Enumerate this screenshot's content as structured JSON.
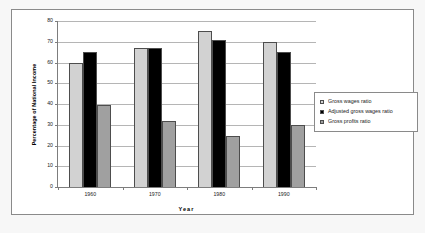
{
  "chart_data": {
    "type": "bar",
    "title": "",
    "subtitle": "",
    "xlabel": "Year",
    "ylabel": "Percentage of National Income",
    "categories": [
      "1960",
      "1970",
      "1980",
      "1990"
    ],
    "series": [
      {
        "name": "Gross wages ratio",
        "color": "#d2d2d2",
        "values": [
          60,
          67,
          75,
          70
        ]
      },
      {
        "name": "Adjusted gross wages ratio",
        "color": "#000000",
        "values": [
          65,
          67,
          71,
          65
        ]
      },
      {
        "name": "Gross profits ratio",
        "color": "#a0a0a0",
        "values": [
          39.5,
          32,
          24.5,
          30
        ]
      }
    ],
    "ylim": [
      0,
      80
    ],
    "yticks": [
      0,
      10,
      20,
      30,
      40,
      50,
      60,
      70,
      80
    ],
    "ytick_labels": [
      "0",
      "10",
      "20",
      "30",
      "40",
      "50",
      "60",
      "70",
      "80"
    ],
    "grid": true,
    "grid_axis": "y",
    "legend_position": "right",
    "plot_background": "#ffffff",
    "figure_background": "#ffffff",
    "border_color": "#8a8a8a"
  }
}
